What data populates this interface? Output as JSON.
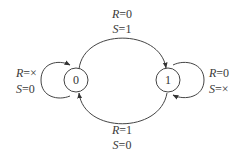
{
  "diagram": {
    "type": "state-diagram",
    "states": [
      {
        "id": "0",
        "label": "0"
      },
      {
        "id": "1",
        "label": "1"
      }
    ],
    "transitions": [
      {
        "from": "0",
        "to": "1",
        "label": {
          "r_var": "R",
          "r_val": "=0",
          "s_var": "S",
          "s_val": "=1"
        }
      },
      {
        "from": "1",
        "to": "0",
        "label": {
          "r_var": "R",
          "r_val": "=1",
          "s_var": "S",
          "s_val": "=0"
        }
      },
      {
        "from": "0",
        "to": "0",
        "label": {
          "r_var": "R",
          "r_val": "=×",
          "s_var": "S",
          "s_val": "=0"
        }
      },
      {
        "from": "1",
        "to": "1",
        "label": {
          "r_var": "R",
          "r_val": "=0",
          "s_var": "S",
          "s_val": "=×"
        }
      }
    ],
    "colors": {
      "stroke": "#444444",
      "text": "#3a3a3a",
      "background": "#ffffff"
    }
  }
}
